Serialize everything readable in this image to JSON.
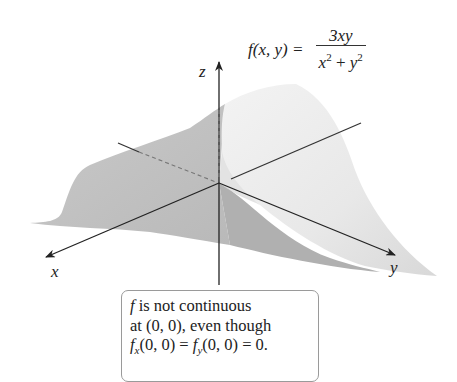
{
  "formula": {
    "lhs": "f(x, y) = ",
    "numerator": "3xy",
    "denominator_x": "x",
    "denominator_plus": " + ",
    "denominator_y": "y",
    "exponent": "2"
  },
  "axes": {
    "x_label": "x",
    "y_label": "y",
    "z_label": "z"
  },
  "note": {
    "line1_f": "f",
    "line1_rest": " is not continuous",
    "line2": "at (0, 0), even though",
    "line3_f1": "f",
    "line3_sub1": "x",
    "line3_mid": "(0, 0) = ",
    "line3_f2": "f",
    "line3_sub2": "y",
    "line3_end": "(0, 0) = 0."
  },
  "colors": {
    "surface_light": "#ececec",
    "surface_mid": "#cfcfcf",
    "surface_dark": "#b5b5b5",
    "axis": "#222222"
  }
}
